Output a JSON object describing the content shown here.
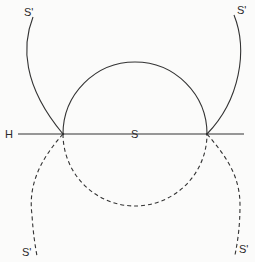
{
  "diagram": {
    "labels": {
      "horizon": "H",
      "center": "S",
      "top_left": "S'",
      "top_right": "S'",
      "bottom_left": "S'",
      "bottom_right": "S'"
    },
    "colors": {
      "stroke": "#333333",
      "background": "#fbfbfa"
    },
    "elements": {
      "horizontal_line": "solid horizontal line H through S",
      "upper_circle_arc": "solid semicircle above H",
      "lower_circle_arc": "dashed semicircle below H",
      "upper_curves": "solid S' curves above H",
      "lower_curves": "dashed S' curves below H"
    }
  }
}
